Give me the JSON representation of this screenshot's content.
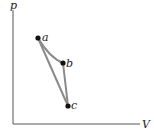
{
  "diagram": {
    "type": "pV-diagram",
    "axes": {
      "y_label": "p",
      "x_label": "V"
    },
    "points": [
      {
        "label": "a",
        "x": 38,
        "y": 38
      },
      {
        "label": "b",
        "x": 63,
        "y": 63
      },
      {
        "label": "c",
        "x": 68,
        "y": 106
      }
    ],
    "paths": [
      {
        "from": "a",
        "to": "b",
        "shape": "curve"
      },
      {
        "from": "b",
        "to": "c",
        "shape": "line"
      },
      {
        "from": "c",
        "to": "a",
        "shape": "line"
      }
    ],
    "colors": {
      "path": "#8a8a8a",
      "axis": "#555555",
      "point": "#111111"
    }
  }
}
